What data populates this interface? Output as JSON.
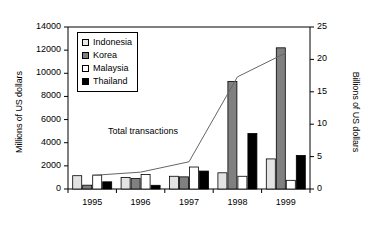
{
  "chart_data": {
    "type": "bar",
    "title": "",
    "subtitle": "",
    "xlabel": "",
    "ylabel": "Millions of US dollars",
    "y2label": "Billions of US dollars",
    "categories": [
      "1995",
      "1996",
      "1997",
      "1998",
      "1999"
    ],
    "ylim": [
      0,
      14000
    ],
    "yticks": [
      0,
      2000,
      4000,
      6000,
      8000,
      10000,
      12000,
      14000
    ],
    "y2lim": [
      0,
      25
    ],
    "y2ticks": [
      0,
      5,
      10,
      15,
      20,
      25
    ],
    "grid": false,
    "legend_position": "upper-left-inside",
    "series": [
      {
        "name": "Indonesia",
        "color": "#e3e3e3",
        "axis": "left",
        "values": [
          1150,
          1000,
          1100,
          1400,
          2600
        ]
      },
      {
        "name": "Korea",
        "color": "#808080",
        "axis": "left",
        "values": [
          330,
          900,
          1050,
          9300,
          12200
        ]
      },
      {
        "name": "Malaysia",
        "color": "#ffffff",
        "axis": "left",
        "values": [
          1200,
          1250,
          1900,
          1100,
          750
        ]
      },
      {
        "name": "Thailand",
        "color": "#000000",
        "axis": "left",
        "values": [
          620,
          320,
          1550,
          4800,
          2900
        ]
      }
    ],
    "line_series": {
      "name": "Total transactions",
      "axis": "right",
      "color": "#666666",
      "values": [
        2.1,
        2.6,
        4.2,
        17.3,
        21.0
      ]
    },
    "annotations": [
      {
        "text": "Total transactions",
        "x": 1996.0,
        "y": 5000
      }
    ]
  },
  "legend": {
    "items": [
      {
        "label": "Indonesia",
        "swatch": "#e9e9e9"
      },
      {
        "label": "Korea",
        "swatch": "#808080"
      },
      {
        "label": "Malaysia",
        "swatch": "#ffffff"
      },
      {
        "label": "Thailand",
        "swatch": "#000000"
      }
    ]
  },
  "axes": {
    "left_title": "Millions of US dollars",
    "right_title": "Billions of US dollars",
    "left_ticks": [
      "14000",
      "12000",
      "10000",
      "8000",
      "6000",
      "4000",
      "2000",
      "0"
    ],
    "right_ticks": [
      "25",
      "20",
      "15",
      "10",
      "5",
      "0"
    ],
    "x_ticks": [
      "1995",
      "1996",
      "1997",
      "1998",
      "1999"
    ]
  },
  "annotation": {
    "total_transactions": "Total transactions"
  }
}
